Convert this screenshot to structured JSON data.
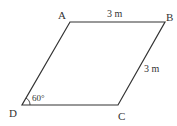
{
  "diagram": {
    "type": "parallelogram",
    "vertices": {
      "A": {
        "label": "A",
        "x": 70,
        "y": 22
      },
      "B": {
        "label": "B",
        "x": 165,
        "y": 22
      },
      "C": {
        "label": "C",
        "x": 118,
        "y": 105
      },
      "D": {
        "label": "D",
        "x": 22,
        "y": 105
      }
    },
    "measurements": {
      "AB": "3 m",
      "BC": "3 m",
      "angle_D": "60°"
    },
    "colors": {
      "stroke": "#333333",
      "text": "#333333"
    }
  }
}
